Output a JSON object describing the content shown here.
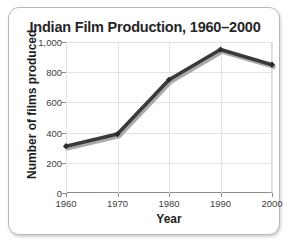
{
  "chart_data": {
    "type": "line",
    "title": "Indian Film Production, 1960–2000",
    "xlabel": "Year",
    "ylabel": "Number of films produced",
    "categories": [
      "1960",
      "1970",
      "1980",
      "1990",
      "2000"
    ],
    "x": [
      1960,
      1970,
      1980,
      1990,
      2000
    ],
    "values": [
      310,
      390,
      750,
      950,
      850
    ],
    "series": [
      {
        "name": "Number of films produced",
        "values": [
          310,
          390,
          750,
          950,
          850
        ]
      }
    ],
    "xtick_labels": [
      "1960",
      "1970",
      "1980",
      "1990",
      "2000"
    ],
    "ytick_labels": [
      "0",
      "200",
      "400",
      "600",
      "800",
      "1,000"
    ],
    "ytick_values": [
      0,
      200,
      400,
      600,
      800,
      1000
    ],
    "ylim": [
      0,
      1000
    ],
    "xlim": [
      1960,
      2000
    ],
    "grid": true,
    "legend": false,
    "legend_position": "none",
    "colors": {
      "line": "#3a3a3a",
      "line_shadow": "#aaaaaa",
      "marker": "#2b2b2b",
      "grid": "#e2e2e2",
      "axis": "#8c8c8c",
      "title_text": "#262626",
      "label_text": "#1f1f1f",
      "tick_text": "#3d3d3d",
      "card_background": "#ffffff",
      "card_border": "#b8b8b8"
    }
  }
}
